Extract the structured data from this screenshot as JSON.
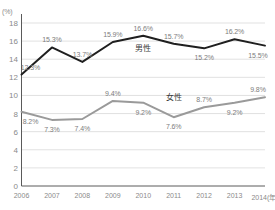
{
  "chart_data": {
    "type": "line",
    "title": "",
    "xlabel": "",
    "ylabel": "",
    "unit_label": "(%)",
    "x_axis_suffix": "(年)",
    "categories": [
      "2006",
      "2007",
      "2008",
      "2009",
      "2010",
      "2011",
      "2012",
      "2013",
      "2014"
    ],
    "xtick_labels": [
      "2006",
      "2007",
      "2008",
      "2009",
      "2010",
      "2011",
      "2012",
      "2013",
      "2014(年)"
    ],
    "ytick_labels": [
      "0",
      "2",
      "4",
      "6",
      "8",
      "10",
      "12",
      "14",
      "16",
      "18"
    ],
    "ytick_values": [
      0,
      2,
      4,
      6,
      8,
      10,
      12,
      14,
      16,
      18
    ],
    "ylim": [
      0,
      18
    ],
    "grid": true,
    "legend_position": "inline",
    "series": [
      {
        "name": "男性",
        "color": "#1f1f1f",
        "values": [
          12.3,
          15.3,
          13.7,
          15.9,
          16.6,
          15.7,
          15.2,
          16.2,
          15.5
        ],
        "data_labels": [
          "12.3%",
          "15.3%",
          "13.7%",
          "15.9%",
          "16.6%",
          "15.7%",
          "15.2%",
          "16.2%",
          "15.5%"
        ],
        "label_positions": [
          "above",
          "above",
          "above",
          "above",
          "above",
          "above",
          "below",
          "above",
          "below"
        ],
        "inline_label": "男性",
        "inline_label_x": 2010,
        "inline_label_y": 15.35
      },
      {
        "name": "女性",
        "color": "#9a9a9a",
        "values": [
          8.2,
          7.3,
          7.4,
          9.4,
          9.2,
          7.6,
          8.7,
          9.2,
          9.8
        ],
        "data_labels": [
          "8.2%",
          "7.3%",
          "7.4%",
          "9.4%",
          "9.2%",
          "7.6%",
          "8.7%",
          "9.2%",
          "9.8%"
        ],
        "label_positions": [
          "below",
          "below",
          "below",
          "above",
          "below",
          "below",
          "above",
          "below",
          "above"
        ],
        "inline_label": "女性",
        "inline_label_x": 2011,
        "inline_label_y": 9.95
      }
    ]
  },
  "colors": {
    "male_line": "#1f1f1f",
    "female_line": "#9a9a9a",
    "grid": "#d9d9d9",
    "axis": "#5a5a5a",
    "tick_text": "#8a8a8a",
    "data_label_text": "#7d7d7d",
    "background": "#ffffff"
  }
}
